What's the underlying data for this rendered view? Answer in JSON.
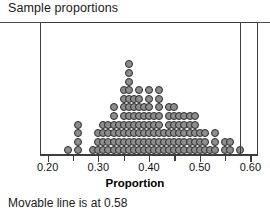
{
  "panel": {
    "title": "Sample proportions"
  },
  "axis": {
    "title": "Proportion",
    "tick_labels": [
      "0.20",
      "0.30",
      "0.40",
      "0.50",
      "0.60"
    ],
    "tick_values": [
      0.2,
      0.3,
      0.4,
      0.5,
      0.6
    ],
    "minor_tick_values": [
      0.25,
      0.35,
      0.45,
      0.55
    ],
    "xmin": 0.185,
    "xmax": 0.615
  },
  "movable_line": {
    "label": "Movable line is at 0.58",
    "value": 0.58,
    "color": "#3d3d3d"
  },
  "style": {
    "dot_fill": "#8c8c8c",
    "dot_stroke": "#2b2b2b",
    "frame_color": "#3d3d3d"
  },
  "chart_data": {
    "type": "bar",
    "title": "Sample proportions",
    "xlabel": "Proportion",
    "ylabel": "",
    "subtitle": "",
    "plot_style": "dotplot",
    "dot_value": 1,
    "xlim": [
      0.185,
      0.615
    ],
    "ylim": [
      0,
      11
    ],
    "grid": false,
    "legend": "none",
    "annotations": [
      {
        "type": "vertical-line",
        "x": 0.58,
        "text": "Movable line is at 0.58"
      }
    ],
    "categories": [
      "0.24",
      "0.26",
      "0.29",
      "0.30",
      "0.31",
      "0.32",
      "0.33",
      "0.34",
      "0.35",
      "0.36",
      "0.37",
      "0.38",
      "0.39",
      "0.40",
      "0.41",
      "0.42",
      "0.43",
      "0.44",
      "0.45",
      "0.46",
      "0.47",
      "0.48",
      "0.49",
      "0.50",
      "0.51",
      "0.52",
      "0.53",
      "0.55",
      "0.56",
      "0.58"
    ],
    "x": [
      0.24,
      0.26,
      0.29,
      0.3,
      0.31,
      0.32,
      0.33,
      0.34,
      0.35,
      0.36,
      0.37,
      0.38,
      0.39,
      0.4,
      0.41,
      0.42,
      0.43,
      0.44,
      0.45,
      0.46,
      0.47,
      0.48,
      0.49,
      0.5,
      0.51,
      0.52,
      0.53,
      0.55,
      0.56,
      0.58
    ],
    "values": [
      1,
      4,
      1,
      3,
      4,
      4,
      6,
      4,
      8,
      11,
      7,
      8,
      6,
      8,
      5,
      8,
      3,
      6,
      6,
      5,
      5,
      5,
      5,
      3,
      3,
      1,
      3,
      2,
      2,
      1
    ]
  }
}
